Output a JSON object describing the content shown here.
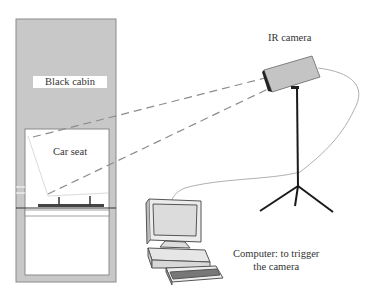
{
  "diagram": {
    "labels": {
      "cabin": "Black cabin",
      "seat": "Car seat",
      "camera": "IR camera",
      "computer_line1": "Computer: to trigger",
      "computer_line2": "the camera"
    },
    "colors": {
      "cabin_fill": "#c8c8c8",
      "cabin_border": "#8a8a8a",
      "camera_fill": "#c4c4c4",
      "line": "#1a1a1a",
      "dashed": "#8c8c8c",
      "cable": "#b0b0b0"
    }
  }
}
